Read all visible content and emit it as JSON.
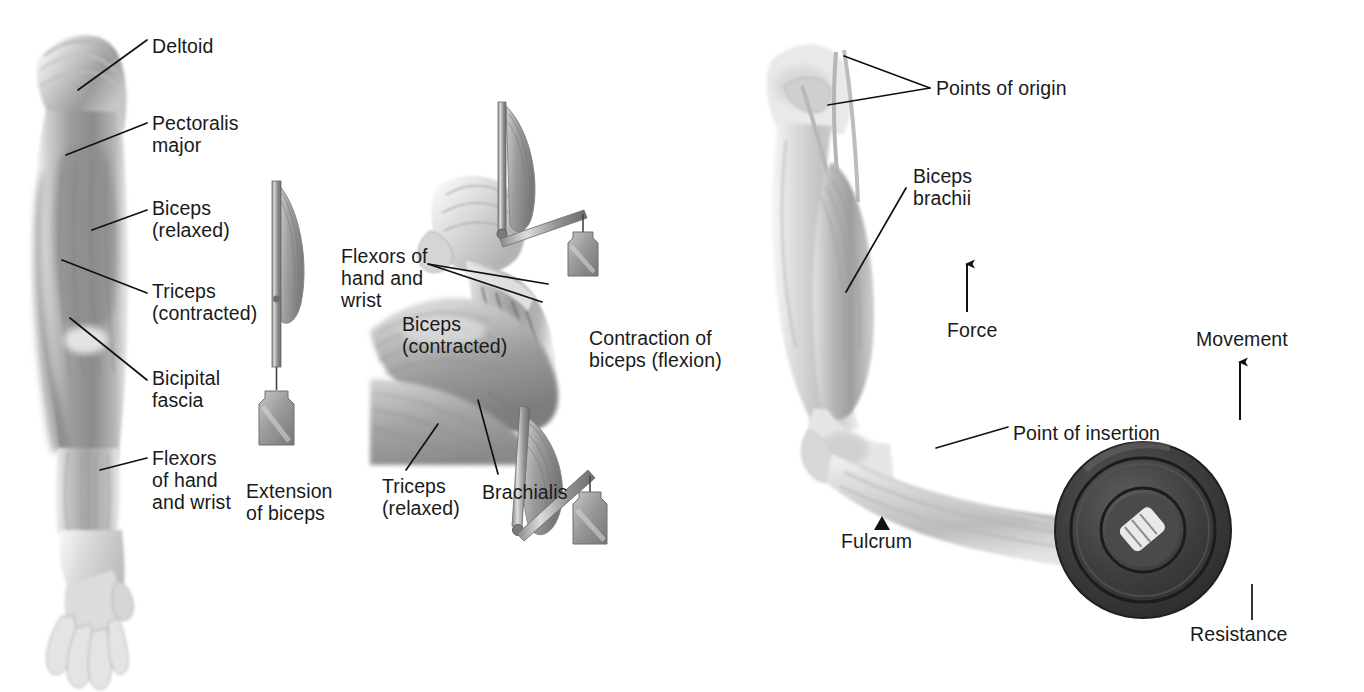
{
  "figure": {
    "kind": "anatomical-illustration",
    "background_color": "#ffffff",
    "label_color": "#1a1a1a",
    "leader_line_color": "#111111"
  },
  "panels": [
    {
      "id": "panel-extension",
      "name": "Arm extended with biceps relaxed",
      "labels": [
        {
          "id": "deltoid",
          "text": "Deltoid",
          "x": 152,
          "y": 45,
          "lines": 1
        },
        {
          "id": "pectoralis-major",
          "text": "Pectoralis\nmajor",
          "x": 152,
          "y": 122,
          "lines": 2
        },
        {
          "id": "biceps-relaxed",
          "text": "Biceps\n(relaxed)",
          "x": 152,
          "y": 200,
          "lines": 2
        },
        {
          "id": "triceps-contracted",
          "text": "Triceps\n(contracted)",
          "x": 152,
          "y": 283,
          "lines": 2
        },
        {
          "id": "bicipital-fascia",
          "text": "Bicipital\nfascia",
          "x": 152,
          "y": 370,
          "lines": 2
        },
        {
          "id": "flexors-left",
          "text": "Flexors\nof hand\nand wrist",
          "x": 152,
          "y": 450,
          "lines": 3
        },
        {
          "id": "extension-of-biceps",
          "text": "Extension\nof biceps",
          "x": 248,
          "y": 483,
          "lines": 2
        }
      ]
    },
    {
      "id": "panel-flexion",
      "name": "Arm flexed with biceps contracted",
      "labels": [
        {
          "id": "flexors-mid",
          "text": "Flexors of\nhand and\nwrist",
          "x": 340,
          "y": 248,
          "lines": 3
        },
        {
          "id": "biceps-contracted",
          "text": "Biceps\n(contracted)",
          "x": 400,
          "y": 317,
          "lines": 2
        },
        {
          "id": "contraction-flexion",
          "text": "Contraction of\nbiceps (flexion)",
          "x": 590,
          "y": 330,
          "lines": 2
        },
        {
          "id": "triceps-relaxed",
          "text": "Triceps\n(relaxed)",
          "x": 381,
          "y": 479,
          "lines": 2
        },
        {
          "id": "brachialis",
          "text": "Brachialis",
          "x": 480,
          "y": 484,
          "lines": 1
        }
      ]
    },
    {
      "id": "panel-lever",
      "name": "Biceps as a third-class lever lifting a weight plate",
      "labels": [
        {
          "id": "points-of-origin",
          "text": "Points of origin",
          "x": 935,
          "y": 85,
          "lines": 1
        },
        {
          "id": "biceps-brachii",
          "text": "Biceps\nbrachii",
          "x": 912,
          "y": 170,
          "lines": 2
        },
        {
          "id": "force",
          "text": "Force",
          "x": 947,
          "y": 325,
          "lines": 1
        },
        {
          "id": "movement",
          "text": "Movement",
          "x": 1196,
          "y": 333,
          "lines": 1
        },
        {
          "id": "point-of-insertion",
          "text": "Point of insertion",
          "x": 1013,
          "y": 428,
          "lines": 1
        },
        {
          "id": "fulcrum",
          "text": "Fulcrum",
          "x": 842,
          "y": 534,
          "lines": 1
        },
        {
          "id": "resistance",
          "text": "Resistance",
          "x": 1191,
          "y": 628,
          "lines": 1
        }
      ],
      "arrows": [
        {
          "id": "force-arrow",
          "direction": "up",
          "x": 967,
          "y_tip": 262,
          "y_tail": 312
        },
        {
          "id": "movement-arrow",
          "direction": "up",
          "x": 1240,
          "y_tip": 360,
          "y_tail": 420
        }
      ],
      "markers": [
        {
          "id": "fulcrum-triangle",
          "shape": "solid-up-triangle",
          "x": 874,
          "y": 519
        }
      ]
    }
  ],
  "lever_diagrams": [
    {
      "id": "lever-extended",
      "state": "muscle relaxed, lever straight",
      "angle_label": "180°",
      "has_weight": true
    },
    {
      "id": "lever-right-angle",
      "state": "muscle partly contracted, lever at 90°",
      "angle_label": "90°",
      "has_weight": true
    },
    {
      "id": "lever-acute",
      "state": "muscle fully contracted, lever acute",
      "angle_label": "45°",
      "has_weight": true
    }
  ]
}
